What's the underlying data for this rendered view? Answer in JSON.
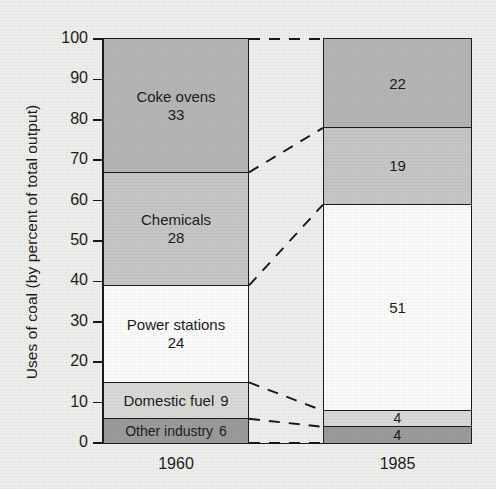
{
  "chart_data": {
    "type": "bar",
    "subtype": "stacked-bar-percent",
    "title": "",
    "xlabel": "",
    "ylabel": "Uses of coal (by percent of total output)",
    "categories": [
      "1960",
      "1985"
    ],
    "ylim": [
      0,
      100
    ],
    "yticks": [
      0,
      10,
      20,
      30,
      40,
      50,
      60,
      70,
      80,
      90,
      100
    ],
    "ytick_labels": [
      "0",
      "10",
      "20",
      "30",
      "40",
      "50",
      "60",
      "70",
      "80",
      "90",
      "100"
    ],
    "grid": false,
    "legend": "none (segments labelled in place)",
    "stack_order_top_to_bottom": [
      "Coke ovens",
      "Chemicals",
      "Power stations",
      "Domestic fuel",
      "Other industry"
    ],
    "series": [
      {
        "name": "Coke ovens",
        "values": [
          33,
          22
        ],
        "color": "#b5b5b5"
      },
      {
        "name": "Chemicals",
        "values": [
          28,
          19
        ],
        "color": "#c6c6c6"
      },
      {
        "name": "Power stations",
        "values": [
          24,
          51
        ],
        "color": "#fbfbfa"
      },
      {
        "name": "Domestic fuel",
        "values": [
          9,
          4
        ],
        "color": "#d9d9d7"
      },
      {
        "name": "Other industry",
        "values": [
          6,
          4
        ],
        "color": "#9b9b9b"
      }
    ],
    "annotations": [
      "Dashed leader lines connect each 1960 segment boundary to the matching 1985 segment boundary"
    ]
  },
  "axis": {
    "y_title": "Uses of coal (by percent of total output)",
    "ticks": [
      "100",
      "90",
      "80",
      "70",
      "60",
      "50",
      "40",
      "30",
      "20",
      "10",
      "0"
    ]
  },
  "bars": {
    "b1960": {
      "label": "1960",
      "segments": [
        {
          "name": "Coke ovens",
          "label": "Coke ovens",
          "value": "33",
          "show_label": true,
          "inline": false
        },
        {
          "name": "Chemicals",
          "label": "Chemicals",
          "value": "28",
          "show_label": true,
          "inline": false
        },
        {
          "name": "Power stations",
          "label": "Power stations",
          "value": "24",
          "show_label": true,
          "inline": false
        },
        {
          "name": "Domestic fuel",
          "label": "Domestic fuel",
          "value": "9",
          "show_label": true,
          "inline": true
        },
        {
          "name": "Other industry",
          "label": "Other industry",
          "value": "6",
          "show_label": true,
          "inline": true
        }
      ]
    },
    "b1985": {
      "label": "1985",
      "segments": [
        {
          "name": "Coke ovens",
          "label": "",
          "value": "22",
          "show_label": false,
          "inline": false
        },
        {
          "name": "Chemicals",
          "label": "",
          "value": "19",
          "show_label": false,
          "inline": false
        },
        {
          "name": "Power stations",
          "label": "",
          "value": "51",
          "show_label": false,
          "inline": false
        },
        {
          "name": "Domestic fuel",
          "label": "",
          "value": "4",
          "show_label": false,
          "inline": false
        },
        {
          "name": "Other industry",
          "label": "",
          "value": "4",
          "show_label": false,
          "inline": false
        }
      ]
    }
  },
  "colors": {
    "coke_ovens": "#b5b5b5",
    "chemicals": "#c6c6c6",
    "power_stations": "#fbfbfa",
    "domestic_fuel": "#d9d9d7",
    "other_industry": "#9b9b9b",
    "background": "#eeeeec",
    "ink": "#15181a"
  }
}
